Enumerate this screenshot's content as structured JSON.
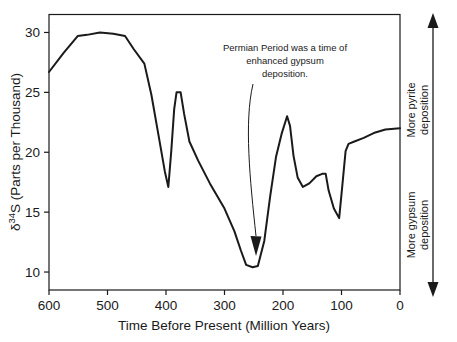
{
  "chart_data": {
    "type": "line",
    "title": "",
    "xlabel": "Time Before Present  (Million Years)",
    "ylabel": "δ 34S  (Parts per Thousand)",
    "ylabel_symbol": "δ",
    "ylabel_superscript": "34",
    "ylabel_rest": "S  (Parts per Thousand)",
    "xlim": [
      600,
      0
    ],
    "ylim": [
      8.5,
      31.5
    ],
    "x_ticks": [
      600,
      500,
      400,
      300,
      200,
      100,
      0
    ],
    "x_tick_labels": [
      "600",
      "500",
      "400",
      "300",
      "200",
      "100",
      "0"
    ],
    "y_ticks": [
      10,
      15,
      20,
      25,
      30
    ],
    "y_tick_labels": [
      "10",
      "15",
      "20",
      "25",
      "30"
    ],
    "grid": false,
    "legend": "none",
    "series": [
      {
        "name": "δ 34S of seawater sulfate",
        "color": "#1a1a1a",
        "points": [
          [
            600,
            26.7
          ],
          [
            575,
            28.3
          ],
          [
            551,
            29.7
          ],
          [
            535,
            29.8
          ],
          [
            513,
            30.0
          ],
          [
            490,
            29.9
          ],
          [
            470,
            29.7
          ],
          [
            455,
            28.6
          ],
          [
            437,
            27.4
          ],
          [
            425,
            24.8
          ],
          [
            412,
            21.2
          ],
          [
            402,
            18.4
          ],
          [
            396,
            17.1
          ],
          [
            391,
            20.1
          ],
          [
            386,
            23.6
          ],
          [
            382,
            25.0
          ],
          [
            375,
            25.0
          ],
          [
            369,
            23.2
          ],
          [
            360,
            20.9
          ],
          [
            345,
            19.3
          ],
          [
            325,
            17.4
          ],
          [
            300,
            15.3
          ],
          [
            283,
            13.4
          ],
          [
            272,
            11.8
          ],
          [
            263,
            10.6
          ],
          [
            252,
            10.4
          ],
          [
            243,
            10.5
          ],
          [
            232,
            12.6
          ],
          [
            222,
            16.3
          ],
          [
            212,
            19.6
          ],
          [
            202,
            21.6
          ],
          [
            193,
            23.0
          ],
          [
            188,
            22.2
          ],
          [
            182,
            19.7
          ],
          [
            175,
            17.9
          ],
          [
            166,
            17.1
          ],
          [
            155,
            17.4
          ],
          [
            143,
            18.0
          ],
          [
            133,
            18.2
          ],
          [
            127,
            18.2
          ],
          [
            122,
            16.8
          ],
          [
            113,
            15.3
          ],
          [
            104,
            14.5
          ],
          [
            99,
            17.0
          ],
          [
            93,
            20.1
          ],
          [
            88,
            20.7
          ],
          [
            78,
            20.9
          ],
          [
            62,
            21.2
          ],
          [
            45,
            21.6
          ],
          [
            25,
            21.9
          ],
          [
            0,
            22.0
          ]
        ]
      }
    ],
    "annotations": [
      {
        "name": "permian-annotation",
        "lines": [
          "Permian Period was a time of",
          "enhanced gypsum",
          "deposition."
        ],
        "points_to_x": 255,
        "points_to_y": 13.0
      }
    ],
    "right_axis": {
      "name": "deposition-direction-axis",
      "up_label_line1": "More pyrite",
      "up_label_line2": "deposition",
      "down_label_line1": "More gypsum",
      "down_label_line2": "deposition"
    }
  },
  "style": {
    "line_color": "#1a1a1a",
    "axis_color": "#1a1a1a",
    "background": "#ffffff",
    "text_color": "#1a1a1a"
  }
}
